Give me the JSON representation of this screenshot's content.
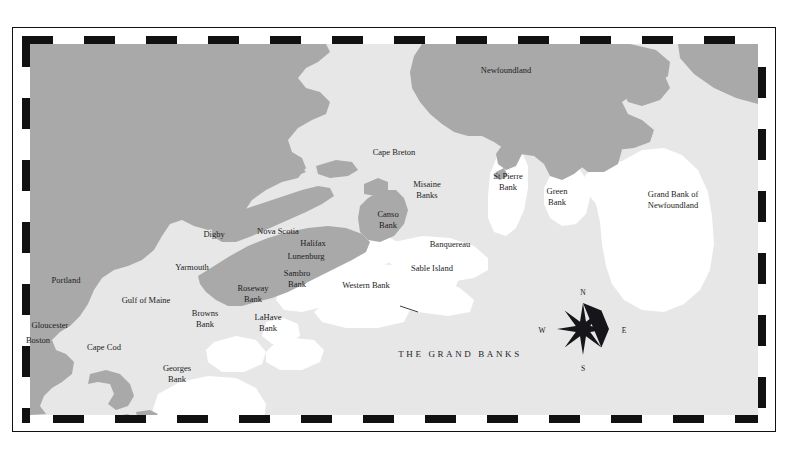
{
  "figure": {
    "title": "THE GRAND BANKS",
    "title_pos": {
      "x": 460,
      "y": 354
    }
  },
  "colors": {
    "page_background": "#ffffff",
    "sea": "#e7e7e7",
    "land": "#a9a9a9",
    "bank": "#ffffff",
    "frame": "#111111",
    "label_text": "#1c1c22"
  },
  "frame": {
    "style": "black-and-white-checkered-border",
    "outer_rule_color": "#111111"
  },
  "compass": {
    "center": {
      "x": 553,
      "y": 285
    },
    "radius": 26,
    "points": 8,
    "directions": [
      {
        "label": "N",
        "x": 553,
        "y": 248
      },
      {
        "label": "E",
        "x": 594,
        "y": 286
      },
      {
        "label": "S",
        "x": 553,
        "y": 324
      },
      {
        "label": "W",
        "x": 512,
        "y": 286
      }
    ]
  },
  "labels": [
    {
      "name": "newfoundland",
      "text": "Newfoundland",
      "x": 506,
      "y": 70,
      "lines": [
        "Newfoundland"
      ]
    },
    {
      "name": "cape-breton",
      "text": "Cape Breton",
      "x": 394,
      "y": 152,
      "lines": [
        "Cape Breton"
      ]
    },
    {
      "name": "st-pierre-bank",
      "text": "St Pierre Bank",
      "x": 508,
      "y": 181,
      "lines": [
        "St Pierre",
        "Bank"
      ]
    },
    {
      "name": "green-bank",
      "text": "Green Bank",
      "x": 557,
      "y": 196,
      "lines": [
        "Green",
        "Bank"
      ]
    },
    {
      "name": "grand-bank-newfoundland",
      "text": "Grand Bank of Newfoundland",
      "x": 673,
      "y": 199,
      "lines": [
        "Grand Bank of",
        "Newfoundland"
      ]
    },
    {
      "name": "misaine-banks",
      "text": "Misaine Banks",
      "x": 427,
      "y": 189,
      "lines": [
        "Misaine",
        "Banks"
      ]
    },
    {
      "name": "canso-bank",
      "text": "Canso Bank",
      "x": 388,
      "y": 219,
      "lines": [
        "Canso",
        "Bank"
      ]
    },
    {
      "name": "banquereau",
      "text": "Banquereau",
      "x": 450,
      "y": 244,
      "lines": [
        "Banquereau"
      ]
    },
    {
      "name": "sable-island",
      "text": "Sable Island",
      "x": 432,
      "y": 268,
      "lines": [
        "Sable Island"
      ]
    },
    {
      "name": "nova-scotia",
      "text": "Nova Scotia",
      "x": 278,
      "y": 231,
      "lines": [
        "Nova Scotia"
      ]
    },
    {
      "name": "halifax",
      "text": "Halifax",
      "x": 313,
      "y": 243,
      "lines": [
        "Halifax"
      ]
    },
    {
      "name": "lunenburg",
      "text": "Lunenburg",
      "x": 306,
      "y": 256,
      "lines": [
        "Lunenburg"
      ]
    },
    {
      "name": "digby",
      "text": "Digby",
      "x": 214,
      "y": 234,
      "lines": [
        "Digby"
      ]
    },
    {
      "name": "yarmouth",
      "text": "Yarmouth",
      "x": 192,
      "y": 267,
      "lines": [
        "Yarmouth"
      ]
    },
    {
      "name": "sambro-bank",
      "text": "Sambro Bank",
      "x": 297,
      "y": 278,
      "lines": [
        "Sambro",
        "Bank"
      ]
    },
    {
      "name": "western-bank",
      "text": "Western Bank",
      "x": 366,
      "y": 285,
      "lines": [
        "Western Bank"
      ]
    },
    {
      "name": "roseway-bank",
      "text": "Roseway Bank",
      "x": 253,
      "y": 293,
      "lines": [
        "Roseway",
        "Bank"
      ]
    },
    {
      "name": "lahave-bank",
      "text": "LaHave Bank",
      "x": 268,
      "y": 322,
      "lines": [
        "LaHave",
        "Bank"
      ]
    },
    {
      "name": "browns-bank",
      "text": "Browns Bank",
      "x": 205,
      "y": 318,
      "lines": [
        "Browns",
        "Bank"
      ]
    },
    {
      "name": "gulf-of-maine",
      "text": "Gulf of Maine",
      "x": 146,
      "y": 300,
      "lines": [
        "Gulf of Maine"
      ]
    },
    {
      "name": "portland",
      "text": "Portland",
      "x": 66,
      "y": 280,
      "lines": [
        "Portland"
      ]
    },
    {
      "name": "gloucester",
      "text": "Gloucester",
      "x": 50,
      "y": 325,
      "lines": [
        "Gloucester"
      ]
    },
    {
      "name": "boston",
      "text": "Boston",
      "x": 38,
      "y": 340,
      "lines": [
        "Boston"
      ]
    },
    {
      "name": "cape-cod",
      "text": "Cape Cod",
      "x": 104,
      "y": 347,
      "lines": [
        "Cape Cod"
      ]
    },
    {
      "name": "georges-bank",
      "text": "Georges Bank",
      "x": 177,
      "y": 373,
      "lines": [
        "Georges",
        "Bank"
      ]
    }
  ]
}
